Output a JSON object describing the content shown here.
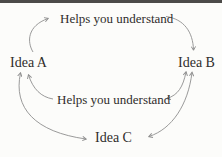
{
  "page": {
    "background": "#fcfcfa",
    "top_bar_color": "#4c4b49"
  },
  "diagram": {
    "type": "concept-cycle",
    "nodes": [
      {
        "id": "idea_a",
        "label": "Idea A"
      },
      {
        "id": "idea_b",
        "label": "Idea B"
      },
      {
        "id": "idea_c",
        "label": "Idea C"
      }
    ],
    "edge_labels": [
      {
        "id": "top",
        "text": "Helps you understand"
      },
      {
        "id": "middle",
        "text": "Helps you understand"
      }
    ],
    "edges": [
      {
        "from": "idea_a",
        "to": "idea_b",
        "via_label": "Helps you understand",
        "direction": "one-way"
      },
      {
        "from": "idea_b",
        "to": "idea_a",
        "via_label": "Helps you understand",
        "direction": "one-way"
      },
      {
        "from": "idea_a",
        "to": "idea_c",
        "direction": "two-way"
      },
      {
        "from": "idea_b",
        "to": "idea_c",
        "direction": "two-way"
      }
    ],
    "colors": {
      "line": "#8f8f8f",
      "text": "#2f2d2b"
    }
  }
}
